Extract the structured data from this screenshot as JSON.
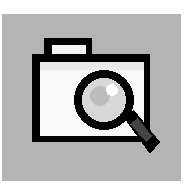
{
  "icon": {
    "name": "folder-search-icon",
    "description": "Folder with magnifying glass",
    "colors": {
      "background": "#b4b4b4",
      "outline": "#000000",
      "fill": "#f8f8f8",
      "lens": "#c8c8c8"
    }
  }
}
